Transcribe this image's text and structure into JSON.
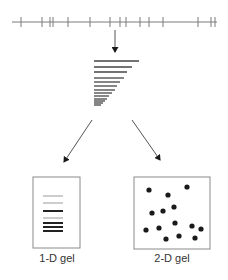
{
  "colors": {
    "line": "#7a7a7a",
    "dark": "#1a1a1a",
    "band_dark": "#222222",
    "band_light": "#9a9a9a",
    "box": "#8a8a8a",
    "text": "#333333"
  },
  "restriction_map": {
    "line": {
      "x1": 12,
      "x2": 217,
      "y": 22
    },
    "ticks_x": [
      21,
      42,
      50,
      53,
      68,
      90,
      110,
      120,
      126,
      140,
      149,
      163,
      198,
      211,
      215
    ]
  },
  "arrows": {
    "down": {
      "x1": 115,
      "y1": 30,
      "x2": 115,
      "y2": 52
    },
    "left": {
      "x1": 92,
      "y1": 120,
      "x2": 64,
      "y2": 162
    },
    "right": {
      "x1": 132,
      "y1": 120,
      "x2": 160,
      "y2": 160
    }
  },
  "fragment_ladder": {
    "x": 94,
    "bands": [
      {
        "y": 61,
        "w": 45
      },
      {
        "y": 67,
        "w": 38
      },
      {
        "y": 72,
        "w": 33
      },
      {
        "y": 78,
        "w": 30
      },
      {
        "y": 82,
        "w": 26
      },
      {
        "y": 86,
        "w": 23
      },
      {
        "y": 90,
        "w": 21
      },
      {
        "y": 93,
        "w": 18
      },
      {
        "y": 96,
        "w": 15
      },
      {
        "y": 99,
        "w": 13
      },
      {
        "y": 101,
        "w": 11
      },
      {
        "y": 103,
        "w": 9
      },
      {
        "y": 105,
        "w": 7
      }
    ]
  },
  "gel_1d": {
    "label": "1-D gel",
    "box": {
      "x": 33,
      "y": 177,
      "w": 47,
      "h": 71
    },
    "bands": [
      {
        "y": 196,
        "x1": 43,
        "x2": 63,
        "tone": "light"
      },
      {
        "y": 203,
        "x1": 43,
        "x2": 63,
        "tone": "light"
      },
      {
        "y": 211,
        "x1": 43,
        "x2": 63,
        "tone": "dark"
      },
      {
        "y": 218,
        "x1": 43,
        "x2": 63,
        "tone": "light"
      },
      {
        "y": 223,
        "x1": 43,
        "x2": 63,
        "tone": "dark"
      },
      {
        "y": 227,
        "x1": 43,
        "x2": 63,
        "tone": "dark"
      },
      {
        "y": 231,
        "x1": 43,
        "x2": 63,
        "tone": "dark"
      }
    ],
    "label_pos": {
      "x": 57,
      "y": 262
    }
  },
  "gel_2d": {
    "label": "2-D gel",
    "box": {
      "x": 134,
      "y": 177,
      "w": 76,
      "h": 72
    },
    "spots": [
      [
        149,
        190
      ],
      [
        168,
        195
      ],
      [
        187,
        187
      ],
      [
        152,
        213
      ],
      [
        163,
        211
      ],
      [
        174,
        207
      ],
      [
        146,
        230
      ],
      [
        159,
        228
      ],
      [
        175,
        223
      ],
      [
        192,
        226
      ],
      [
        201,
        229
      ],
      [
        166,
        239
      ],
      [
        179,
        236
      ],
      [
        195,
        238
      ]
    ],
    "label_pos": {
      "x": 172,
      "y": 262
    }
  }
}
